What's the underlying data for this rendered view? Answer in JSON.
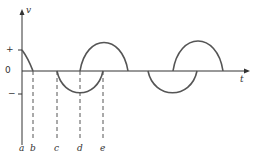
{
  "diagram": {
    "axes": {
      "y_label": "v",
      "x_label": "t",
      "zero_label": "0",
      "plus_label": "+",
      "minus_label": "−"
    },
    "markers": [
      "a",
      "b",
      "c",
      "d",
      "e"
    ],
    "colors": {
      "curve": "#555555",
      "axis": "#333333",
      "dash": "#555555"
    }
  }
}
